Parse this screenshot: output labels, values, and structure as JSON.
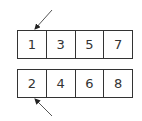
{
  "rows": [
    {
      "cells": [
        "1",
        "3",
        "5",
        "7"
      ]
    },
    {
      "cells": [
        "2",
        "4",
        "6",
        "8"
      ]
    }
  ],
  "arrows": [
    {
      "name": "top-arrow",
      "from": [
        52,
        10
      ],
      "to": [
        35,
        29
      ]
    },
    {
      "name": "bottom-arrow",
      "from": [
        52,
        116
      ],
      "to": [
        35,
        99
      ]
    }
  ],
  "colors": {
    "stroke": "#333333",
    "background": "#ffffff"
  }
}
